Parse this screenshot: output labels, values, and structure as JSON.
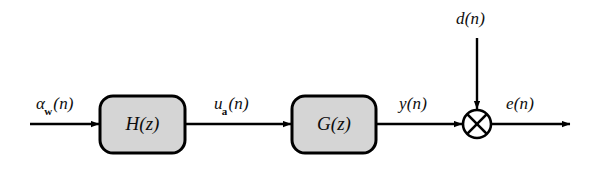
{
  "diagram": {
    "background_color": "#ffffff",
    "stroke_color": "#000000",
    "block_fill_color": "#d5d5d5",
    "blocks": [
      {
        "id": "filter-h",
        "label": "H(z)",
        "label_main": "H",
        "label_arg": "(z)",
        "x": 100,
        "y": 96,
        "width": 85,
        "height": 57
      },
      {
        "id": "filter-g",
        "label": "G(z)",
        "label_main": "G",
        "label_arg": "(z)",
        "x": 292,
        "y": 96,
        "width": 84,
        "height": 57
      }
    ],
    "junction": {
      "id": "summing-junction",
      "symbol": "circled-cross",
      "cx": 477,
      "cy": 124,
      "r": 14
    },
    "signals": [
      {
        "id": "input-alpha-w",
        "base": "α",
        "sub": "w",
        "arg": "(n)",
        "text": "αw(n)",
        "x": 36,
        "y": 95
      },
      {
        "id": "inter-u-a",
        "base": "u",
        "sub": "a",
        "arg": "(n)",
        "text": "ua(n)",
        "x": 214,
        "y": 95
      },
      {
        "id": "output-y",
        "base": "y",
        "sub": "",
        "arg": "(n)",
        "text": "y(n)",
        "x": 399,
        "y": 95
      },
      {
        "id": "disturbance-d",
        "base": "d",
        "sub": "",
        "arg": "(n)",
        "text": "d(n)",
        "x": 456,
        "y": 10
      },
      {
        "id": "error-e",
        "base": "e",
        "sub": "",
        "arg": "(n)",
        "text": "e(n)",
        "x": 506,
        "y": 95
      }
    ],
    "arrows": [
      {
        "id": "arrow-input-to-h",
        "from": "source",
        "to": "filter-h",
        "orientation": "horizontal"
      },
      {
        "id": "arrow-h-to-g",
        "from": "filter-h",
        "to": "filter-g",
        "orientation": "horizontal"
      },
      {
        "id": "arrow-g-to-junction",
        "from": "filter-g",
        "to": "summing-junction",
        "orientation": "horizontal"
      },
      {
        "id": "arrow-d-to-junction",
        "from": "disturbance",
        "to": "summing-junction",
        "orientation": "vertical"
      },
      {
        "id": "arrow-junction-to-error",
        "from": "summing-junction",
        "to": "sink",
        "orientation": "horizontal"
      }
    ]
  }
}
